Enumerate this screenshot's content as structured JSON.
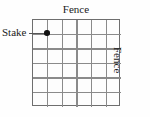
{
  "figure": {
    "background_color": "#fefefe"
  },
  "labels": {
    "fence_top": "Fence",
    "fence_right": "Fence",
    "stake": "Stake"
  },
  "grid": {
    "columns": 6,
    "rows": 6,
    "line_color": "#8a8a8a",
    "border_color": "#6e6e6e",
    "cell_fill": "#fdfdfd",
    "left_px": 32,
    "top_px": 19,
    "width_px": 88,
    "height_px": 87
  },
  "stake": {
    "marker_color": "#111111",
    "leader_color": "#555555",
    "grid_column_index": 1,
    "grid_row_index": 1,
    "x_px": 46.7,
    "y_px": 33.0
  }
}
